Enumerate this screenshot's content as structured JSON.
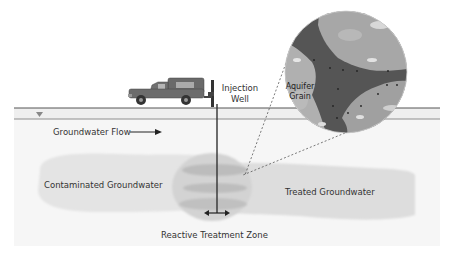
{
  "diagram": {
    "labels": {
      "injection_well_line1": "Injection",
      "injection_well_line2": "Well",
      "aquifer_grain_line1": "Aquifer",
      "aquifer_grain_line2": "Grain",
      "groundwater_flow": "Groundwater Flow",
      "contaminated": "Contaminated Groundwater",
      "treated": "Treated Groundwater",
      "treatment_zone": "Reactive Treatment Zone"
    },
    "icons": {
      "vehicle": "pickup-truck-with-drill-rig",
      "water_table": "water-table-triangle",
      "flow_arrow": "arrow-right",
      "spread_arrow": "double-arrow-horizontal"
    },
    "colors": {
      "ground_line": "#555555",
      "aquifer_fill": "#f1f1f1",
      "contaminated_plume": "#e2e2e2",
      "treated_plume": "#dcdcdc",
      "treatment_zone": "#cfcfcf",
      "treatment_layer": "#bdbdbd",
      "pore_space": "#555555",
      "grain_light": "#aaaaaa",
      "text": "#333333"
    }
  }
}
